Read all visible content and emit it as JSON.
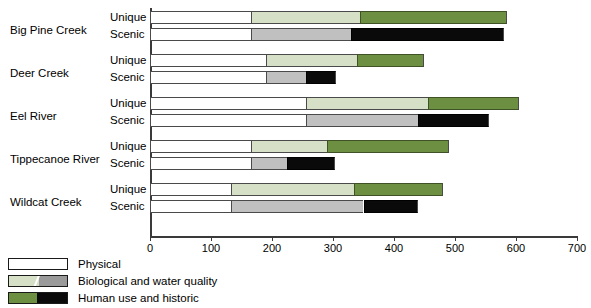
{
  "chart_data": {
    "type": "bar",
    "orientation": "horizontal",
    "stacked": true,
    "title": "",
    "xlabel": "",
    "ylabel": "",
    "xlim": [
      0,
      700
    ],
    "xticks": [
      0,
      100,
      200,
      300,
      400,
      500,
      600,
      700
    ],
    "grid": false,
    "legend_position": "below",
    "series": [
      {
        "name": "Physical",
        "color": "#ffffff"
      },
      {
        "name": "Biological and water quality",
        "color_unique": "#d6e0c6",
        "color_scenic": "#c0c0c0"
      },
      {
        "name": "Human use and historic",
        "color_unique": "#6d8f42",
        "color_scenic": "#0a0a0a"
      }
    ],
    "groups": [
      {
        "name": "Big Pine Creek",
        "rows": [
          {
            "label": "Unique",
            "values": [
              165,
              180,
              240
            ],
            "cumulative": [
              165,
              345,
              585
            ]
          },
          {
            "label": "Scenic",
            "values": [
              165,
              165,
              250
            ],
            "cumulative": [
              165,
              330,
              580
            ]
          }
        ]
      },
      {
        "name": "Deer Creek",
        "rows": [
          {
            "label": "Unique",
            "values": [
              190,
              150,
              110
            ],
            "cumulative": [
              190,
              340,
              450
            ]
          },
          {
            "label": "Scenic",
            "values": [
              190,
              65,
              50
            ],
            "cumulative": [
              190,
              255,
              305
            ]
          }
        ]
      },
      {
        "name": "Eel River",
        "rows": [
          {
            "label": "Unique",
            "values": [
              255,
              200,
              150
            ],
            "cumulative": [
              255,
              455,
              605
            ]
          },
          {
            "label": "Scenic",
            "values": [
              255,
              185,
              115
            ],
            "cumulative": [
              255,
              440,
              555
            ]
          }
        ]
      },
      {
        "name": "Tippecanoe River",
        "rows": [
          {
            "label": "Unique",
            "values": [
              165,
              125,
              200
            ],
            "cumulative": [
              165,
              290,
              490
            ]
          },
          {
            "label": "Scenic",
            "values": [
              165,
              60,
              78
            ],
            "cumulative": [
              165,
              225,
              303
            ]
          }
        ]
      },
      {
        "name": "Wildcat Creek",
        "rows": [
          {
            "label": "Unique",
            "values": [
              133,
              202,
              145
            ],
            "cumulative": [
              133,
              335,
              480
            ]
          },
          {
            "label": "Scenic",
            "values": [
              133,
              217,
              90
            ],
            "cumulative": [
              133,
              350,
              440
            ]
          }
        ]
      }
    ]
  },
  "legend": {
    "items": [
      {
        "label": "Physical",
        "swatch": "physical-swatch"
      },
      {
        "label": "Biological and water quality",
        "swatch": "biological-swatch"
      },
      {
        "label": "Human use and historic",
        "swatch": "human-use-swatch"
      }
    ]
  }
}
